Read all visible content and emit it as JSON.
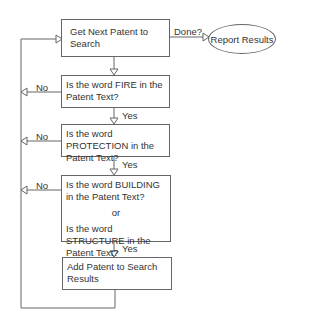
{
  "nodes": {
    "get_next": "Get Next Patent to Search",
    "report": "Report Results",
    "q_fire": "Is the word FIRE in the Patent Text?",
    "q_protection": "Is the word PROTECTION in the Patent Text?",
    "q_building": "Is the word BUILDING in the Patent Text?",
    "or": "or",
    "q_structure": "Is the word STRUCTURE in the Patent Text?",
    "add": "Add Patent to Search Results"
  },
  "edges": {
    "done": "Done?",
    "no_1": "No",
    "no_2": "No",
    "no_3": "No",
    "yes_1": "Yes",
    "yes_2": "Yes",
    "yes_3": "Yes"
  },
  "colors": {
    "line": "#666666",
    "text": "#333333"
  }
}
